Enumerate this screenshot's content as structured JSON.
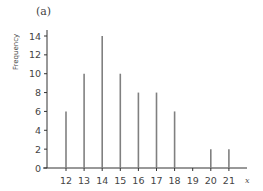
{
  "panel_label": "(a)",
  "chart_data": {
    "type": "bar",
    "style": "stick/line plot",
    "title": "(a)",
    "xlabel": "x",
    "ylabel": "Frequency",
    "categories": [
      12,
      13,
      14,
      15,
      16,
      17,
      18,
      19,
      20,
      21
    ],
    "values": [
      6,
      10,
      14,
      10,
      8,
      8,
      6,
      0,
      2,
      2
    ],
    "yticks": [
      0,
      2,
      4,
      6,
      8,
      10,
      12,
      14
    ],
    "xticks": [
      12,
      13,
      14,
      15,
      16,
      17,
      18,
      19,
      20,
      21
    ],
    "ylim": [
      0,
      14.5
    ],
    "grid": false,
    "legend": null,
    "colors": {
      "bar": "#808080",
      "axis": "#333333"
    }
  }
}
